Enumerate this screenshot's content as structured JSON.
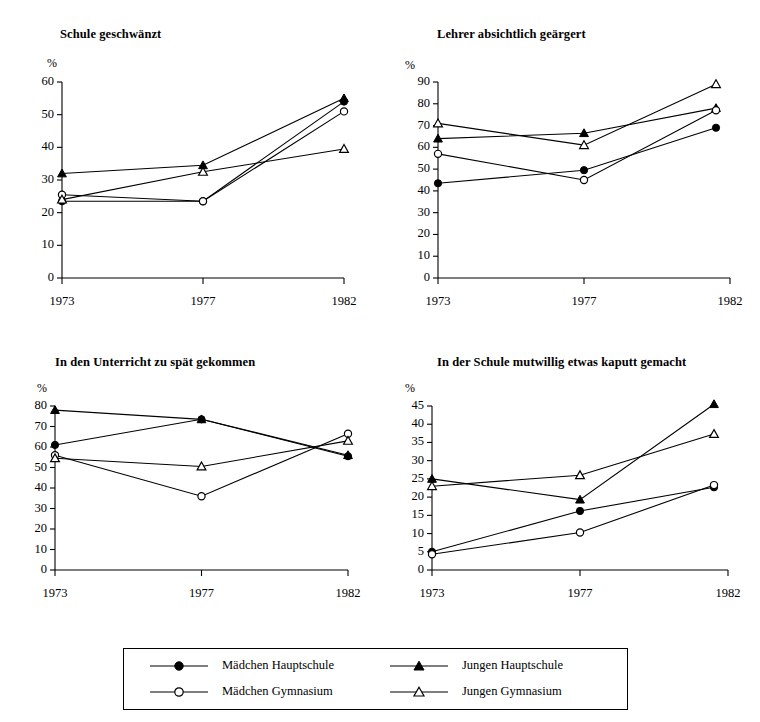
{
  "figure": {
    "years": [
      "1973",
      "1977",
      "1982"
    ],
    "percent_symbol": "%",
    "series_names": {
      "maedchen_hauptschule": "Mädchen Hauptschule",
      "jungen_hauptschule": "Jungen  Hauptschule",
      "maedchen_gymnasium": "Mädchen Gymnasium",
      "jungen_gymnasium": "Jungen  Gymnasium"
    }
  },
  "legend": {
    "items": [
      {
        "label": "Mädchen Hauptschule",
        "marker": "filled-circle-icon"
      },
      {
        "label": "Jungen  Hauptschule",
        "marker": "filled-triangle-icon"
      },
      {
        "label": "Mädchen Gymnasium",
        "marker": "open-circle-icon"
      },
      {
        "label": "Jungen  Gymnasium",
        "marker": "open-triangle-icon"
      }
    ]
  },
  "chart_data": [
    {
      "type": "line",
      "title": "Schule geschwänzt",
      "xlabel": "",
      "ylabel": "%",
      "x": [
        "1973",
        "1977",
        "1982"
      ],
      "yticks": [
        0,
        10,
        20,
        30,
        40,
        50,
        60
      ],
      "ylim": [
        0,
        60
      ],
      "grid": false,
      "legend_position": "below-figure",
      "series": [
        {
          "name": "Mädchen Hauptschule",
          "marker": "filled-circle",
          "values": [
            23.5,
            23.5,
            54
          ]
        },
        {
          "name": "Jungen  Hauptschule",
          "marker": "filled-triangle",
          "values": [
            32,
            34.5,
            55
          ]
        },
        {
          "name": "Mädchen Gymnasium",
          "marker": "open-circle",
          "values": [
            25.5,
            23.5,
            51
          ]
        },
        {
          "name": "Jungen  Gymnasium",
          "marker": "open-triangle",
          "values": [
            24,
            32.5,
            39.5
          ]
        }
      ]
    },
    {
      "type": "line",
      "title": "Lehrer absichtlich geärgert",
      "xlabel": "",
      "ylabel": "%",
      "x": [
        "1973",
        "1977",
        "1982"
      ],
      "yticks": [
        0,
        10,
        20,
        30,
        40,
        50,
        60,
        70,
        80,
        90
      ],
      "ylim": [
        0,
        90
      ],
      "grid": false,
      "legend_position": "below-figure",
      "series": [
        {
          "name": "Mädchen Hauptschule",
          "marker": "filled-circle",
          "values": [
            43.5,
            49.5,
            69
          ]
        },
        {
          "name": "Jungen  Hauptschule",
          "marker": "filled-triangle",
          "values": [
            64,
            66.5,
            78
          ]
        },
        {
          "name": "Mädchen Gymnasium",
          "marker": "open-circle",
          "values": [
            57,
            45,
            77
          ]
        },
        {
          "name": "Jungen  Gymnasium",
          "marker": "open-triangle",
          "values": [
            71,
            61,
            89
          ]
        }
      ]
    },
    {
      "type": "line",
      "title": "In den Unterricht zu spät gekommen",
      "xlabel": "",
      "ylabel": "%",
      "x": [
        "1973",
        "1977",
        "1982"
      ],
      "yticks": [
        0,
        10,
        20,
        30,
        40,
        50,
        60,
        70,
        80
      ],
      "ylim": [
        0,
        80
      ],
      "grid": false,
      "legend_position": "below-figure",
      "series": [
        {
          "name": "Mädchen Hauptschule",
          "marker": "filled-circle",
          "values": [
            61,
            73.5,
            55.5
          ]
        },
        {
          "name": "Jungen  Hauptschule",
          "marker": "filled-triangle",
          "values": [
            78,
            73.5,
            56
          ]
        },
        {
          "name": "Mädchen Gymnasium",
          "marker": "open-circle",
          "values": [
            56,
            36,
            66.5
          ]
        },
        {
          "name": "Jungen  Gymnasium",
          "marker": "open-triangle",
          "values": [
            54.5,
            50.5,
            63
          ]
        }
      ]
    },
    {
      "type": "line",
      "title": "In der Schule mutwillig etwas kaputt gemacht",
      "xlabel": "",
      "ylabel": "%",
      "x": [
        "1973",
        "1977",
        "1982"
      ],
      "yticks": [
        0,
        5,
        10,
        15,
        20,
        25,
        30,
        35,
        40,
        45
      ],
      "ylim": [
        0,
        45
      ],
      "grid": false,
      "legend_position": "below-figure",
      "series": [
        {
          "name": "Mädchen Hauptschule",
          "marker": "filled-circle",
          "values": [
            5,
            16.2,
            22.7
          ]
        },
        {
          "name": "Jungen  Hauptschule",
          "marker": "filled-triangle",
          "values": [
            25,
            19.3,
            45.5
          ]
        },
        {
          "name": "Mädchen Gymnasium",
          "marker": "open-circle",
          "values": [
            4.3,
            10.3,
            23.3
          ]
        },
        {
          "name": "Jungen  Gymnasium",
          "marker": "open-triangle",
          "values": [
            23,
            26,
            37.3
          ]
        }
      ]
    }
  ]
}
